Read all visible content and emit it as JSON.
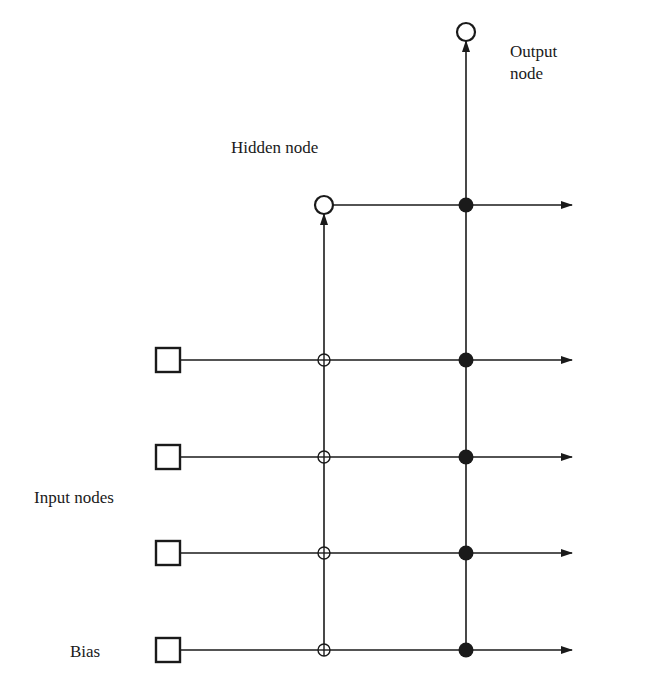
{
  "diagram": {
    "type": "cascade-correlation neural network",
    "labels": {
      "output_node": [
        "Output",
        "node"
      ],
      "hidden_node": "Hidden node",
      "input_nodes": "Input nodes",
      "bias": "Bias"
    },
    "nodes": {
      "inputs": [
        {
          "id": "input-1",
          "shape": "square",
          "row_y": 360
        },
        {
          "id": "input-2",
          "shape": "square",
          "row_y": 457
        },
        {
          "id": "input-3",
          "shape": "square",
          "row_y": 553
        },
        {
          "id": "bias",
          "shape": "square",
          "row_y": 650
        }
      ],
      "hidden": [
        {
          "id": "hidden-1",
          "shape": "open-circle",
          "x": 324,
          "y": 205
        }
      ],
      "outputs": [
        {
          "id": "output-1",
          "shape": "open-circle",
          "x": 466,
          "y": 32
        }
      ]
    },
    "connections": {
      "frozen_weights_symbol": "open-circle-cross",
      "trainable_weights_symbol": "filled-circle",
      "hidden_column_x": 324,
      "output_column_x": 466,
      "arrow_end_x": 572
    },
    "colors": {
      "ink": "#1a1a1a",
      "background": "#ffffff"
    }
  }
}
